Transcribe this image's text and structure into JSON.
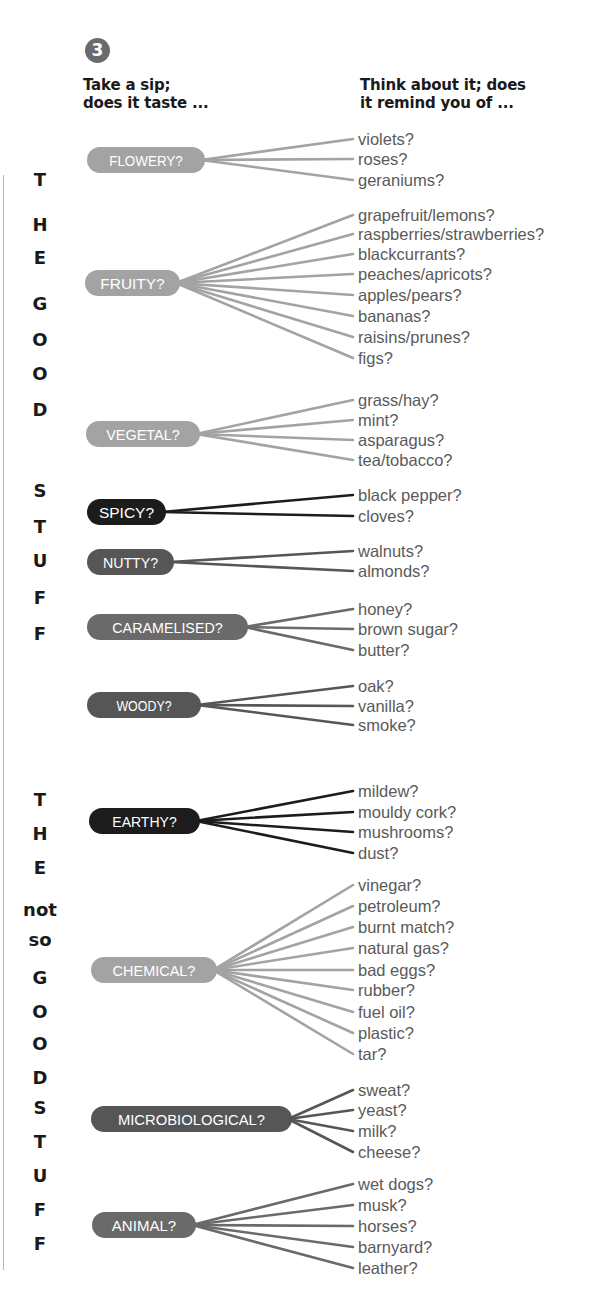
{
  "step": {
    "number": "3",
    "left_heading": [
      "Take a sip;",
      "does it taste ..."
    ],
    "right_heading": [
      "Think about it; does",
      "it remind you of ..."
    ]
  },
  "side_labels": {
    "good": [
      "T",
      "H",
      "E",
      "",
      "G",
      "O",
      "O",
      "D",
      "",
      "S",
      "T",
      "U",
      "F",
      "F"
    ],
    "not_so_good": [
      "T",
      "H",
      "E",
      "not",
      "so",
      "G",
      "O",
      "O",
      "D",
      "S",
      "T",
      "U",
      "F",
      "F"
    ]
  },
  "colors": {
    "light_gray": "#a3a3a3",
    "mid_gray": "#6a6a6a",
    "dark_gray": "#565656",
    "near_black": "#1c1c1c",
    "item_text": "#5a5a5a",
    "heading_text": "#1a1a1a",
    "rule": "#b5b5b5"
  },
  "chart_data": {
    "type": "tree",
    "sections": [
      {
        "name": "THE GOOD STUFF",
        "categories": [
          {
            "label": "FLOWERY?",
            "tone": "light_gray",
            "items": [
              "violets?",
              "roses?",
              "geraniums?"
            ]
          },
          {
            "label": "FRUITY?",
            "tone": "light_gray",
            "items": [
              "grapefruit/lemons?",
              "raspberries/strawberries?",
              "blackcurrants?",
              "peaches/apricots?",
              "apples/pears?",
              "bananas?",
              "raisins/prunes?",
              "figs?"
            ]
          },
          {
            "label": "VEGETAL?",
            "tone": "light_gray",
            "items": [
              "grass/hay?",
              "mint?",
              "asparagus?",
              "tea/tobacco?"
            ]
          },
          {
            "label": "SPICY?",
            "tone": "near_black",
            "items": [
              "black pepper?",
              "cloves?"
            ]
          },
          {
            "label": "NUTTY?",
            "tone": "dark_gray",
            "items": [
              "walnuts?",
              "almonds?"
            ]
          },
          {
            "label": "CARAMELISED?",
            "tone": "mid_gray",
            "items": [
              "honey?",
              "brown sugar?",
              "butter?"
            ]
          },
          {
            "label": "WOODY?",
            "tone": "dark_gray",
            "items": [
              "oak?",
              "vanilla?",
              "smoke?"
            ]
          }
        ]
      },
      {
        "name": "THE not so GOOD STUFF",
        "categories": [
          {
            "label": "EARTHY?",
            "tone": "near_black",
            "items": [
              "mildew?",
              "mouldy cork?",
              "mushrooms?",
              "dust?"
            ]
          },
          {
            "label": "CHEMICAL?",
            "tone": "light_gray",
            "items": [
              "vinegar?",
              "petroleum?",
              "burnt match?",
              "natural gas?",
              "bad eggs?",
              "rubber?",
              "fuel oil?",
              "plastic?",
              "tar?"
            ]
          },
          {
            "label": "MICROBIOLOGICAL?",
            "tone": "dark_gray",
            "items": [
              "sweat?",
              "yeast?",
              "milk?",
              "cheese?"
            ]
          },
          {
            "label": "ANIMAL?",
            "tone": "mid_gray",
            "items": [
              "wet dogs?",
              "musk?",
              "horses?",
              "barnyard?",
              "leather?"
            ]
          }
        ]
      }
    ]
  }
}
